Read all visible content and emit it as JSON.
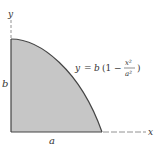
{
  "figure": {
    "axis_labels": {
      "y": "y",
      "x": "x"
    },
    "dimension_labels": {
      "height": "b",
      "width": "a"
    },
    "equation": {
      "lhs": "y",
      "equals": "=",
      "coef": "b",
      "open": "(1 −",
      "frac_num": "x²",
      "frac_den": "a²",
      "close": ")"
    },
    "colors": {
      "fill": "#c4c4c4",
      "stroke": "#444444",
      "axis": "#555555"
    }
  }
}
